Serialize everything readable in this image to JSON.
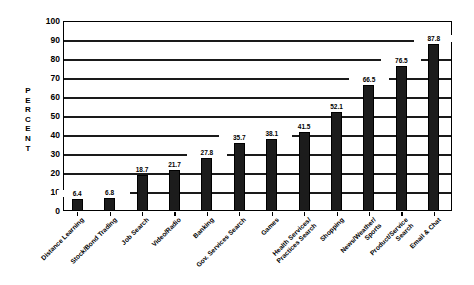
{
  "chart_data": {
    "type": "bar",
    "title": "",
    "xlabel": "",
    "ylabel": "PERCENT",
    "ylim": [
      0,
      100
    ],
    "yticks": [
      0,
      10,
      20,
      30,
      40,
      50,
      60,
      70,
      80,
      90,
      100
    ],
    "grid": true,
    "legend": false,
    "orientation": "vertical",
    "bar_color": "#1c1c1c",
    "categories": [
      "Distance Learning",
      "Stock/Bond Trading",
      "Job Search",
      "Video/Radio",
      "Banking",
      "Gov. Services Search",
      "Games",
      "Health Services/ Practices Search",
      "Shopping",
      "News/Weather/ Sports",
      "Product/Service Search",
      "Email & Chat"
    ],
    "category_lines": [
      [
        "Distance Learning"
      ],
      [
        "Stock/Bond Trading"
      ],
      [
        "Job Search"
      ],
      [
        "Video/Radio"
      ],
      [
        "Banking"
      ],
      [
        "Gov. Services Search"
      ],
      [
        "Games"
      ],
      [
        "Health Services/",
        "Practices Search"
      ],
      [
        "Shopping"
      ],
      [
        "News/Weather/",
        "Sports"
      ],
      [
        "Product/Service",
        "Search"
      ],
      [
        "Email & Chat"
      ]
    ],
    "values": [
      6.4,
      6.8,
      18.7,
      21.7,
      27.8,
      35.7,
      38.1,
      41.5,
      52.1,
      66.5,
      76.5,
      87.8
    ],
    "value_labels": [
      "6.4",
      "6.8",
      "18.7",
      "21.7",
      "27.8",
      "35.7",
      "38.1",
      "41.5",
      "52.1",
      "66.5",
      "76.5",
      "87.8"
    ],
    "ylabel_letters": [
      "P",
      "E",
      "R",
      "C",
      "E",
      "N",
      "T"
    ]
  }
}
